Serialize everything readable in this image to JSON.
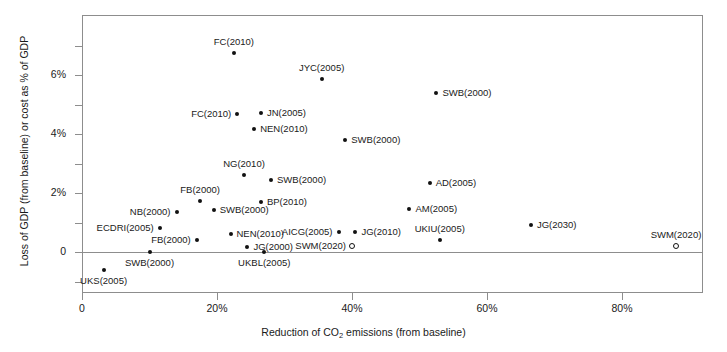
{
  "chart_data": {
    "type": "scatter",
    "title": "",
    "xlabel": "Reduction of CO2 emissions (from baseline)",
    "ylabel": "Loss of GDP (from baseline) or cost as % of GDP",
    "xlim": [
      0,
      92
    ],
    "ylim": [
      -1.4,
      7.8
    ],
    "grid": false,
    "legend": null,
    "x_ticks": [
      "0",
      "20%",
      "40%",
      "60%",
      "80%"
    ],
    "x_tick_values": [
      0,
      20,
      40,
      60,
      80
    ],
    "y_ticks": [
      "0",
      "2%",
      "4%",
      "6%"
    ],
    "y_tick_values": [
      0,
      2,
      4,
      6
    ],
    "y_minor_tick_values": [
      -1,
      1,
      3,
      5,
      7
    ],
    "points": [
      {
        "label": "FC(2010)",
        "x": 22.5,
        "y": 6.75,
        "marker": "filled",
        "label_pos": "top"
      },
      {
        "label": "JYC(2005)",
        "x": 35.5,
        "y": 5.85,
        "marker": "filled",
        "label_pos": "top"
      },
      {
        "label": "SWB(2000)",
        "x": 52.5,
        "y": 5.38,
        "marker": "filled",
        "label_pos": "rgt"
      },
      {
        "label": "FC(2010)",
        "x": 23.0,
        "y": 4.68,
        "marker": "filled",
        "label_pos": "lft"
      },
      {
        "label": "JN(2005)",
        "x": 26.5,
        "y": 4.7,
        "marker": "filled",
        "label_pos": "rgt"
      },
      {
        "label": "NEN(2010)",
        "x": 25.5,
        "y": 4.18,
        "marker": "filled",
        "label_pos": "rgt"
      },
      {
        "label": "SWB(2000)",
        "x": 39.0,
        "y": 3.8,
        "marker": "filled",
        "label_pos": "rgt"
      },
      {
        "label": "NG(2010)",
        "x": 24.0,
        "y": 2.62,
        "marker": "filled",
        "label_pos": "top"
      },
      {
        "label": "SWB(2000)",
        "x": 28.0,
        "y": 2.45,
        "marker": "filled",
        "label_pos": "rgt"
      },
      {
        "label": "AD(2005)",
        "x": 51.5,
        "y": 2.35,
        "marker": "filled",
        "label_pos": "rgt"
      },
      {
        "label": "FB(2000)",
        "x": 17.5,
        "y": 1.72,
        "marker": "filled",
        "label_pos": "top"
      },
      {
        "label": "BP(2010)",
        "x": 26.5,
        "y": 1.7,
        "marker": "filled",
        "label_pos": "rgt"
      },
      {
        "label": "AM(2005)",
        "x": 48.5,
        "y": 1.45,
        "marker": "filled",
        "label_pos": "rgt"
      },
      {
        "label": "NB(2000)",
        "x": 14.0,
        "y": 1.35,
        "marker": "filled",
        "label_pos": "lft"
      },
      {
        "label": "SWB(2000)",
        "x": 19.5,
        "y": 1.42,
        "marker": "filled",
        "label_pos": "rgt"
      },
      {
        "label": "ECDRI(2005)",
        "x": 11.5,
        "y": 0.82,
        "marker": "filled",
        "label_pos": "lft"
      },
      {
        "label": "AICG(2005)",
        "x": 38.0,
        "y": 0.68,
        "marker": "filled",
        "label_pos": "lft"
      },
      {
        "label": "JG(2010)",
        "x": 40.5,
        "y": 0.68,
        "marker": "filled",
        "label_pos": "rgt"
      },
      {
        "label": "UKIU(2005)",
        "x": 53.0,
        "y": 0.4,
        "marker": "filled",
        "label_pos": "top"
      },
      {
        "label": "JG(2030)",
        "x": 66.5,
        "y": 0.9,
        "marker": "filled",
        "label_pos": "rgt"
      },
      {
        "label": "FB(2000)",
        "x": 17.0,
        "y": 0.42,
        "marker": "filled",
        "label_pos": "lft"
      },
      {
        "label": "NEN(2010)",
        "x": 22.0,
        "y": 0.62,
        "marker": "filled",
        "label_pos": "rgt"
      },
      {
        "label": "JG(2000)",
        "x": 24.5,
        "y": 0.18,
        "marker": "filled",
        "label_pos": "rgt"
      },
      {
        "label": "SWM(2020)",
        "x": 40.0,
        "y": 0.22,
        "marker": "open",
        "label_pos": "lft"
      },
      {
        "label": "SWM(2020)",
        "x": 88.0,
        "y": 0.22,
        "marker": "open",
        "label_pos": "top"
      },
      {
        "label": "SWB(2000)",
        "x": 10.0,
        "y": 0.0,
        "marker": "filled",
        "label_pos": "bot"
      },
      {
        "label": "UKBL(2005)",
        "x": 27.0,
        "y": 0.0,
        "marker": "filled",
        "label_pos": "bot"
      },
      {
        "label": "UKS(2005)",
        "x": 3.2,
        "y": -0.62,
        "marker": "filled",
        "label_pos": "bot"
      }
    ]
  }
}
